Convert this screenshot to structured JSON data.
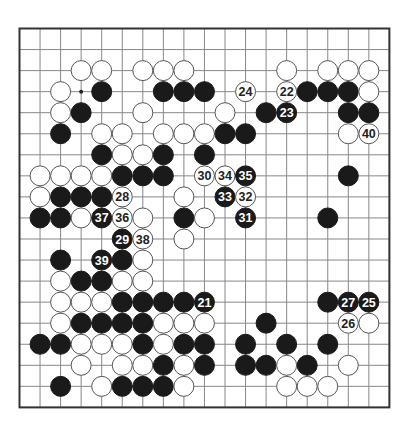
{
  "board": {
    "size": 19,
    "origin_x": 19.5,
    "origin_y": 28.5,
    "step_x": 20.55,
    "step_y": 21.05,
    "stone_radius": 10,
    "colors": {
      "background": "#ffffff",
      "grid": "#888888",
      "border": "#333333",
      "black_stone": "#1a1a1a",
      "white_stone": "#ffffff",
      "white_outline": "#555555",
      "black_label": "#ffffff",
      "white_label": "#222222"
    },
    "star_points": [
      [
        3,
        3
      ]
    ],
    "stones": [
      {
        "c": 3,
        "r": 2,
        "color": "W"
      },
      {
        "c": 4,
        "r": 2,
        "color": "W"
      },
      {
        "c": 6,
        "r": 2,
        "color": "W"
      },
      {
        "c": 7,
        "r": 2,
        "color": "W"
      },
      {
        "c": 8,
        "r": 2,
        "color": "W"
      },
      {
        "c": 13,
        "r": 2,
        "color": "W"
      },
      {
        "c": 15,
        "r": 2,
        "color": "W"
      },
      {
        "c": 16,
        "r": 2,
        "color": "W"
      },
      {
        "c": 17,
        "r": 2,
        "color": "W"
      },
      {
        "c": 2,
        "r": 3,
        "color": "W"
      },
      {
        "c": 4,
        "r": 3,
        "color": "B"
      },
      {
        "c": 7,
        "r": 3,
        "color": "B"
      },
      {
        "c": 8,
        "r": 3,
        "color": "B"
      },
      {
        "c": 9,
        "r": 3,
        "color": "B"
      },
      {
        "c": 11,
        "r": 3,
        "color": "W",
        "label": "24"
      },
      {
        "c": 13,
        "r": 3,
        "color": "W",
        "label": "22"
      },
      {
        "c": 14,
        "r": 3,
        "color": "B"
      },
      {
        "c": 15,
        "r": 3,
        "color": "B"
      },
      {
        "c": 16,
        "r": 3,
        "color": "B"
      },
      {
        "c": 17,
        "r": 3,
        "color": "W"
      },
      {
        "c": 2,
        "r": 4,
        "color": "W"
      },
      {
        "c": 3,
        "r": 4,
        "color": "B"
      },
      {
        "c": 6,
        "r": 4,
        "color": "W"
      },
      {
        "c": 10,
        "r": 4,
        "color": "W"
      },
      {
        "c": 12,
        "r": 4,
        "color": "B"
      },
      {
        "c": 13,
        "r": 4,
        "color": "B",
        "label": "23"
      },
      {
        "c": 16,
        "r": 4,
        "color": "B"
      },
      {
        "c": 17,
        "r": 4,
        "color": "B"
      },
      {
        "c": 2,
        "r": 5,
        "color": "B"
      },
      {
        "c": 4,
        "r": 5,
        "color": "W"
      },
      {
        "c": 5,
        "r": 5,
        "color": "W"
      },
      {
        "c": 7,
        "r": 5,
        "color": "W"
      },
      {
        "c": 8,
        "r": 5,
        "color": "W"
      },
      {
        "c": 9,
        "r": 5,
        "color": "W"
      },
      {
        "c": 10,
        "r": 5,
        "color": "B"
      },
      {
        "c": 11,
        "r": 5,
        "color": "B"
      },
      {
        "c": 16,
        "r": 5,
        "color": "W"
      },
      {
        "c": 17,
        "r": 5,
        "color": "W",
        "label": "40"
      },
      {
        "c": 4,
        "r": 6,
        "color": "B"
      },
      {
        "c": 5,
        "r": 6,
        "color": "W"
      },
      {
        "c": 6,
        "r": 6,
        "color": "W"
      },
      {
        "c": 7,
        "r": 6,
        "color": "B"
      },
      {
        "c": 9,
        "r": 6,
        "color": "B"
      },
      {
        "c": 1,
        "r": 7,
        "color": "W"
      },
      {
        "c": 2,
        "r": 7,
        "color": "W"
      },
      {
        "c": 3,
        "r": 7,
        "color": "W"
      },
      {
        "c": 4,
        "r": 7,
        "color": "W"
      },
      {
        "c": 5,
        "r": 7,
        "color": "B"
      },
      {
        "c": 6,
        "r": 7,
        "color": "B"
      },
      {
        "c": 7,
        "r": 7,
        "color": "B"
      },
      {
        "c": 9,
        "r": 7,
        "color": "W",
        "label": "30"
      },
      {
        "c": 10,
        "r": 7,
        "color": "W",
        "label": "34"
      },
      {
        "c": 11,
        "r": 7,
        "color": "B",
        "label": "35"
      },
      {
        "c": 16,
        "r": 7,
        "color": "B"
      },
      {
        "c": 1,
        "r": 8,
        "color": "W"
      },
      {
        "c": 2,
        "r": 8,
        "color": "B"
      },
      {
        "c": 3,
        "r": 8,
        "color": "B"
      },
      {
        "c": 4,
        "r": 8,
        "color": "B"
      },
      {
        "c": 5,
        "r": 8,
        "color": "W",
        "label": "28"
      },
      {
        "c": 8,
        "r": 8,
        "color": "W"
      },
      {
        "c": 10,
        "r": 8,
        "color": "B",
        "label": "33"
      },
      {
        "c": 11,
        "r": 8,
        "color": "W",
        "label": "32"
      },
      {
        "c": 1,
        "r": 9,
        "color": "B"
      },
      {
        "c": 2,
        "r": 9,
        "color": "B"
      },
      {
        "c": 3,
        "r": 9,
        "color": "W"
      },
      {
        "c": 4,
        "r": 9,
        "color": "B",
        "label": "37"
      },
      {
        "c": 5,
        "r": 9,
        "color": "W",
        "label": "36"
      },
      {
        "c": 6,
        "r": 9,
        "color": "W"
      },
      {
        "c": 8,
        "r": 9,
        "color": "B"
      },
      {
        "c": 9,
        "r": 9,
        "color": "W"
      },
      {
        "c": 11,
        "r": 9,
        "color": "B",
        "label": "31"
      },
      {
        "c": 15,
        "r": 9,
        "color": "B"
      },
      {
        "c": 5,
        "r": 10,
        "color": "B",
        "label": "29"
      },
      {
        "c": 6,
        "r": 10,
        "color": "W",
        "label": "38"
      },
      {
        "c": 8,
        "r": 10,
        "color": "W"
      },
      {
        "c": 2,
        "r": 11,
        "color": "B"
      },
      {
        "c": 4,
        "r": 11,
        "color": "B",
        "label": "39"
      },
      {
        "c": 5,
        "r": 11,
        "color": "B"
      },
      {
        "c": 6,
        "r": 11,
        "color": "W"
      },
      {
        "c": 2,
        "r": 12,
        "color": "W"
      },
      {
        "c": 3,
        "r": 12,
        "color": "B"
      },
      {
        "c": 4,
        "r": 12,
        "color": "B"
      },
      {
        "c": 5,
        "r": 12,
        "color": "W"
      },
      {
        "c": 6,
        "r": 12,
        "color": "W"
      },
      {
        "c": 2,
        "r": 13,
        "color": "W"
      },
      {
        "c": 3,
        "r": 13,
        "color": "W"
      },
      {
        "c": 4,
        "r": 13,
        "color": "W"
      },
      {
        "c": 5,
        "r": 13,
        "color": "B"
      },
      {
        "c": 6,
        "r": 13,
        "color": "B"
      },
      {
        "c": 7,
        "r": 13,
        "color": "B"
      },
      {
        "c": 8,
        "r": 13,
        "color": "B"
      },
      {
        "c": 9,
        "r": 13,
        "color": "B",
        "label": "21"
      },
      {
        "c": 15,
        "r": 13,
        "color": "B"
      },
      {
        "c": 16,
        "r": 13,
        "color": "B",
        "label": "27"
      },
      {
        "c": 17,
        "r": 13,
        "color": "B",
        "label": "25"
      },
      {
        "c": 2,
        "r": 14,
        "color": "W"
      },
      {
        "c": 3,
        "r": 14,
        "color": "B"
      },
      {
        "c": 4,
        "r": 14,
        "color": "B"
      },
      {
        "c": 5,
        "r": 14,
        "color": "B"
      },
      {
        "c": 6,
        "r": 14,
        "color": "B"
      },
      {
        "c": 7,
        "r": 14,
        "color": "W"
      },
      {
        "c": 8,
        "r": 14,
        "color": "W"
      },
      {
        "c": 9,
        "r": 14,
        "color": "W"
      },
      {
        "c": 12,
        "r": 14,
        "color": "B"
      },
      {
        "c": 16,
        "r": 14,
        "color": "W",
        "label": "26"
      },
      {
        "c": 17,
        "r": 14,
        "color": "W"
      },
      {
        "c": 1,
        "r": 15,
        "color": "B"
      },
      {
        "c": 2,
        "r": 15,
        "color": "B"
      },
      {
        "c": 3,
        "r": 15,
        "color": "W"
      },
      {
        "c": 4,
        "r": 15,
        "color": "W"
      },
      {
        "c": 5,
        "r": 15,
        "color": "W"
      },
      {
        "c": 6,
        "r": 15,
        "color": "B"
      },
      {
        "c": 7,
        "r": 15,
        "color": "W"
      },
      {
        "c": 8,
        "r": 15,
        "color": "B"
      },
      {
        "c": 9,
        "r": 15,
        "color": "B"
      },
      {
        "c": 11,
        "r": 15,
        "color": "B"
      },
      {
        "c": 13,
        "r": 15,
        "color": "B"
      },
      {
        "c": 15,
        "r": 15,
        "color": "B"
      },
      {
        "c": 3,
        "r": 16,
        "color": "W"
      },
      {
        "c": 5,
        "r": 16,
        "color": "W"
      },
      {
        "c": 6,
        "r": 16,
        "color": "W"
      },
      {
        "c": 7,
        "r": 16,
        "color": "B"
      },
      {
        "c": 8,
        "r": 16,
        "color": "W"
      },
      {
        "c": 9,
        "r": 16,
        "color": "B"
      },
      {
        "c": 11,
        "r": 16,
        "color": "B"
      },
      {
        "c": 12,
        "r": 16,
        "color": "B"
      },
      {
        "c": 13,
        "r": 16,
        "color": "W"
      },
      {
        "c": 14,
        "r": 16,
        "color": "B"
      },
      {
        "c": 16,
        "r": 16,
        "color": "W"
      },
      {
        "c": 2,
        "r": 17,
        "color": "B"
      },
      {
        "c": 4,
        "r": 17,
        "color": "W"
      },
      {
        "c": 5,
        "r": 17,
        "color": "B"
      },
      {
        "c": 6,
        "r": 17,
        "color": "B"
      },
      {
        "c": 7,
        "r": 17,
        "color": "B"
      },
      {
        "c": 8,
        "r": 17,
        "color": "W"
      },
      {
        "c": 13,
        "r": 17,
        "color": "W"
      },
      {
        "c": 14,
        "r": 17,
        "color": "W"
      },
      {
        "c": 15,
        "r": 17,
        "color": "W"
      }
    ]
  }
}
